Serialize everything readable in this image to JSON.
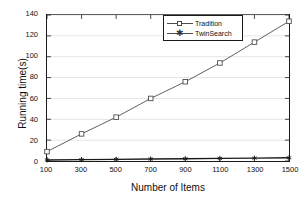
{
  "chart_data": {
    "type": "line",
    "title": "",
    "xlabel": "Number of Items",
    "ylabel": "Running time(s)",
    "categories": [
      100,
      300,
      500,
      700,
      900,
      1100,
      1300,
      1500
    ],
    "x": [
      100,
      300,
      500,
      700,
      900,
      1100,
      1300,
      1500
    ],
    "xticklabels": [
      "100",
      "300",
      "500",
      "700",
      "900",
      "1100",
      "1300",
      "1500"
    ],
    "yticklabels": [
      "0",
      "20",
      "40",
      "60",
      "80",
      "100",
      "120",
      "140"
    ],
    "yticks": [
      0,
      20,
      40,
      60,
      80,
      100,
      120,
      140
    ],
    "xlim": [
      100,
      1500
    ],
    "ylim": [
      0,
      140
    ],
    "grid": "horizontal",
    "legend_position": "top-center-right",
    "series": [
      {
        "name": "Tradition",
        "marker": "square",
        "color": "#4d4d4d",
        "values": [
          9,
          26,
          42,
          60,
          76,
          94,
          114,
          134
        ]
      },
      {
        "name": "TwinSearch",
        "marker": "asterisk",
        "color": "#1a1a1a",
        "values": [
          1,
          1.3,
          1.6,
          1.9,
          2.2,
          2.5,
          2.8,
          3.1
        ]
      }
    ]
  }
}
